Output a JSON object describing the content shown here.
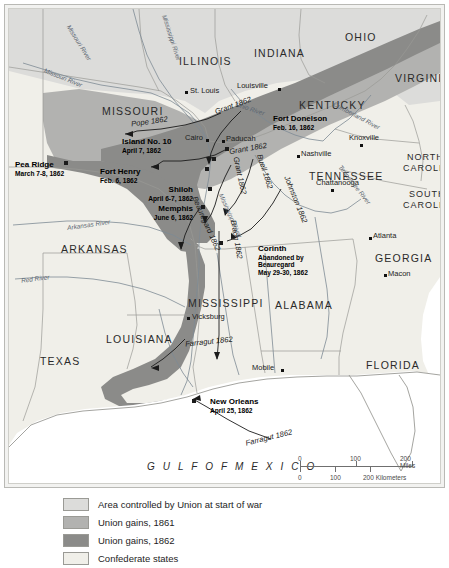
{
  "map": {
    "title": "Civil War in the West, 1861-1862",
    "states": [
      {
        "name": "ILLINOIS",
        "x": 170,
        "y": 46,
        "size": "lg"
      },
      {
        "name": "INDIANA",
        "x": 245,
        "y": 38,
        "size": "lg"
      },
      {
        "name": "OHIO",
        "x": 336,
        "y": 22,
        "size": "lg"
      },
      {
        "name": "VIRGINIA",
        "x": 386,
        "y": 63,
        "size": "lg"
      },
      {
        "name": "KENTUCKY",
        "x": 290,
        "y": 90,
        "size": "lg"
      },
      {
        "name": "MISSOURI",
        "x": 93,
        "y": 96,
        "size": "lg"
      },
      {
        "name": "TENNESSEE",
        "x": 300,
        "y": 161,
        "size": "lg"
      },
      {
        "name": "NORTH",
        "x": 398,
        "y": 143,
        "size": "sm"
      },
      {
        "name": "CAROLINA",
        "x": 394,
        "y": 154,
        "size": "sm"
      },
      {
        "name": "SOUTH",
        "x": 400,
        "y": 180,
        "size": "sm"
      },
      {
        "name": "CAROLINA",
        "x": 394,
        "y": 191,
        "size": "sm"
      },
      {
        "name": "ARKANSAS",
        "x": 52,
        "y": 234,
        "size": "lg"
      },
      {
        "name": "GEORGIA",
        "x": 366,
        "y": 243,
        "size": "lg"
      },
      {
        "name": "ALABAMA",
        "x": 266,
        "y": 290,
        "size": "lg"
      },
      {
        "name": "MISSISSIPPI",
        "x": 179,
        "y": 288,
        "size": "lg"
      },
      {
        "name": "LOUISIANA",
        "x": 97,
        "y": 324,
        "size": "lg"
      },
      {
        "name": "TEXAS",
        "x": 31,
        "y": 346,
        "size": "lg"
      },
      {
        "name": "FLORIDA",
        "x": 357,
        "y": 350,
        "size": "lg"
      }
    ],
    "cities": [
      {
        "name": "St. Louis",
        "x": 176,
        "y": 82,
        "dx": -5,
        "dy": 2
      },
      {
        "name": "Louisville",
        "x": 269,
        "y": 79,
        "dx": -41,
        "dy": -4
      },
      {
        "name": "Knoxville",
        "x": 351,
        "y": 135,
        "dx": -2,
        "dy": -9
      },
      {
        "name": "Nashville",
        "x": 288,
        "y": 146,
        "dx": 3,
        "dy": -4
      },
      {
        "name": "Chattanooga",
        "x": 322,
        "y": 180,
        "dx": -3,
        "dy": -9
      },
      {
        "name": "Atlanta",
        "x": 360,
        "y": 228,
        "dx": 3,
        "dy": -4
      },
      {
        "name": "Macon",
        "x": 375,
        "y": 265,
        "dx": 3,
        "dy": -3
      },
      {
        "name": "Cairo",
        "x": 197,
        "y": 130,
        "dx": -23,
        "dy": -4
      },
      {
        "name": "Paducah",
        "x": 213,
        "y": 131,
        "dx": 3,
        "dy": -4
      },
      {
        "name": "Vicksburg",
        "x": 178,
        "y": 308,
        "dx": 4,
        "dy": -4
      },
      {
        "name": "Mobile",
        "x": 272,
        "y": 360,
        "dx": -28,
        "dy": -4
      }
    ],
    "battles": [
      {
        "name": "Pea Ridge",
        "date": "March 7-8, 1862",
        "x": 6,
        "y": 152,
        "align": "left"
      },
      {
        "name": "Fort Henry",
        "date": "Feb. 6, 1862",
        "x": 91,
        "y": 159,
        "align": "left"
      },
      {
        "name": "Island No. 10",
        "date": "April 7, 1862",
        "x": 113,
        "y": 129,
        "align": "left"
      },
      {
        "name": "Shiloh",
        "date": "April 6-7, 1862",
        "x": 124,
        "y": 177,
        "align": "right"
      },
      {
        "name": "Memphis",
        "date": "June 6, 1862",
        "x": 124,
        "y": 196,
        "align": "right"
      },
      {
        "name": "Fort Donelson",
        "date": "Feb. 16, 1862",
        "x": 264,
        "y": 106,
        "align": "left"
      },
      {
        "name": "New Orleans",
        "date": "April 25, 1862",
        "x": 207,
        "y": 389,
        "align": "left"
      }
    ],
    "corinth": {
      "lines": [
        "Corinth",
        "Abandoned by",
        "Beauregard",
        "May 29-30, 1862"
      ],
      "x": 255,
      "y": 243
    },
    "rivers": [
      {
        "name": "Missouri River",
        "x": 50,
        "y": 30,
        "rot": 58
      },
      {
        "name": "Missouri River",
        "x": 34,
        "y": 65,
        "rot": 35
      },
      {
        "name": "Mississippi River",
        "x": 139,
        "y": 25,
        "rot": 72
      },
      {
        "name": "Ohio River",
        "x": 230,
        "y": 98,
        "rot": 18
      },
      {
        "name": "Cumberland River",
        "x": 322,
        "y": 105,
        "rot": 28
      },
      {
        "name": "Tennessee River",
        "x": 328,
        "y": 175,
        "rot": 58
      },
      {
        "name": "Arkansas River",
        "x": 60,
        "y": 212,
        "rot": -8
      },
      {
        "name": "Red River",
        "x": 12,
        "y": 266,
        "rot": -7
      },
      {
        "name": "Mississippi River",
        "x": 200,
        "y": 205,
        "rot": 66
      }
    ],
    "movements": [
      {
        "name": "Pope 1862",
        "x": 131,
        "y": 112,
        "rot": -8
      },
      {
        "name": "Grant 1862",
        "x": 213,
        "y": 95,
        "rot": -22
      },
      {
        "name": "Grant 1862",
        "x": 229,
        "y": 137,
        "rot": -10
      },
      {
        "name": "Grant 1862",
        "x": 221,
        "y": 165,
        "rot": 78
      },
      {
        "name": "Buell 1862",
        "x": 247,
        "y": 160,
        "rot": 72
      },
      {
        "name": "Johnston 1862",
        "x": 275,
        "y": 190,
        "rot": 68
      },
      {
        "name": "Beauregard 1862",
        "x": 182,
        "y": 215,
        "rot": 66
      },
      {
        "name": "Bragg 1862",
        "x": 216,
        "y": 230,
        "rot": 80
      },
      {
        "name": "Farragut 1862",
        "x": 181,
        "y": 333,
        "rot": -6
      },
      {
        "name": "Farragut 1862",
        "x": 247,
        "y": 427,
        "rot": -14
      }
    ],
    "ocean_label": "G U L F   O F   M E X I C O"
  },
  "scale": {
    "miles": {
      "ticks": [
        "0",
        "100",
        "200 Miles"
      ],
      "positions": [
        0,
        53,
        106
      ]
    },
    "kilometers": {
      "ticks": [
        "0",
        "100",
        "200 Kilometers"
      ],
      "positions": [
        0,
        33,
        66
      ]
    }
  },
  "legend": [
    {
      "label": "Area controlled by Union at start of war",
      "color": "#dcdcda"
    },
    {
      "label": "Union gains, 1861",
      "color": "#b2b2b0"
    },
    {
      "label": "Union gains, 1862",
      "color": "#8b8b89"
    },
    {
      "label": "Confederate states",
      "color": "#f0efe9"
    }
  ],
  "colors": {
    "union_start": "#dcdcda",
    "union_1861": "#b2b2b0",
    "union_1862": "#8b8b89",
    "confederate": "#f0efe9",
    "water": "#ffffff",
    "border": "#9a9a95",
    "page_bg": "#ffffff"
  }
}
